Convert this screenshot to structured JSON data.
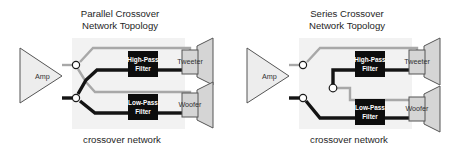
{
  "page": {
    "background": "#ffffff",
    "width": 458,
    "height": 150
  },
  "colors": {
    "hot_wire": "#141414",
    "cold_wire": "#a8a8a8",
    "filter_fill": "#0d0d0d",
    "filter_text": "#ffffff",
    "speaker_fill": "#d5d5d5",
    "amp_fill": "#ededed",
    "panel_fill": "#f2f2f2",
    "outline": "#555555",
    "text": "#262626"
  },
  "diagrams": [
    {
      "id": "parallel",
      "title_line1": "Parallel Crossover",
      "title_line2": "Network Topology",
      "caption": "crossover network",
      "amp_label": "Amp",
      "high_pass_line1": "High-Pass",
      "high_pass_line2": "Filter",
      "low_pass_line1": "Low-Pass",
      "low_pass_line2": "Filter",
      "tweeter_label": "Tweeter",
      "woofer_label": "Woofer",
      "junction_count": 2
    },
    {
      "id": "series",
      "title_line1": "Series Crossover",
      "title_line2": "Network Topology",
      "caption": "crossover network",
      "amp_label": "Amp",
      "high_pass_line1": "High-Pass",
      "high_pass_line2": "Filter",
      "low_pass_line1": "Low-Pass",
      "low_pass_line2": "Filter",
      "tweeter_label": "Tweeter",
      "woofer_label": "Woofer",
      "junction_count": 3
    }
  ],
  "icons": {
    "amp": "amplifier-triangle-icon",
    "speaker": "loudspeaker-cone-icon",
    "junction": "wire-junction-node-icon",
    "filter": "filter-block-icon"
  }
}
